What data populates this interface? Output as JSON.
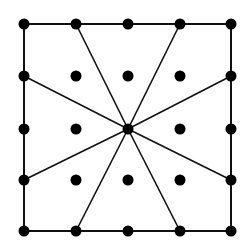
{
  "diagram": {
    "background": "#ffffff",
    "stroke_color": "#111111",
    "dot_color": "#000000",
    "grid": {
      "xs": [
        24,
        76,
        128,
        180,
        231
      ],
      "ys": [
        24,
        76,
        129,
        180,
        231
      ],
      "dot_radius": 5.5
    },
    "border": {
      "x1": 24,
      "y1": 24,
      "x2": 231,
      "y2": 231
    },
    "center": {
      "x": 128,
      "y": 129
    },
    "spoke_endpoints": [
      {
        "x": 76,
        "y": 24
      },
      {
        "x": 180,
        "y": 24
      },
      {
        "x": 231,
        "y": 76
      },
      {
        "x": 231,
        "y": 180
      },
      {
        "x": 180,
        "y": 231
      },
      {
        "x": 76,
        "y": 231
      },
      {
        "x": 24,
        "y": 180
      },
      {
        "x": 24,
        "y": 76
      }
    ]
  }
}
